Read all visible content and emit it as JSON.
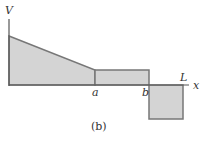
{
  "diagram": {
    "type": "shear-force-diagram",
    "axis_labels": {
      "y": "V",
      "x": "x"
    },
    "points": {
      "a": "a",
      "b": "b",
      "L": "L"
    },
    "caption": "(b)",
    "colors": {
      "fill": "#d4d4d4",
      "stroke": "#777777",
      "axis": "#555555",
      "text": "#333333"
    }
  }
}
